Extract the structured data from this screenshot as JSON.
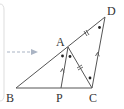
{
  "diagram": {
    "type": "geometry",
    "points": {
      "A": {
        "label": "A",
        "x": 68,
        "y": 47
      },
      "B": {
        "label": "B",
        "x": 16,
        "y": 88
      },
      "C": {
        "label": "C",
        "x": 92,
        "y": 88
      },
      "D": {
        "label": "D",
        "x": 105,
        "y": 17
      },
      "P": {
        "label": "P",
        "x": 61,
        "y": 88
      }
    },
    "segments": [
      "BD",
      "BC",
      "AC",
      "AP",
      "CD"
    ],
    "parallel_marks": [
      "AP",
      "DC"
    ],
    "equal_length_marks": [
      "AD",
      "AC"
    ],
    "angle_dots": [
      "BAP",
      "PAC",
      "ADC",
      "ACD"
    ],
    "colors": {
      "line": "#555555",
      "arrow": "#aab4c4",
      "frame": "#dddddd"
    }
  }
}
